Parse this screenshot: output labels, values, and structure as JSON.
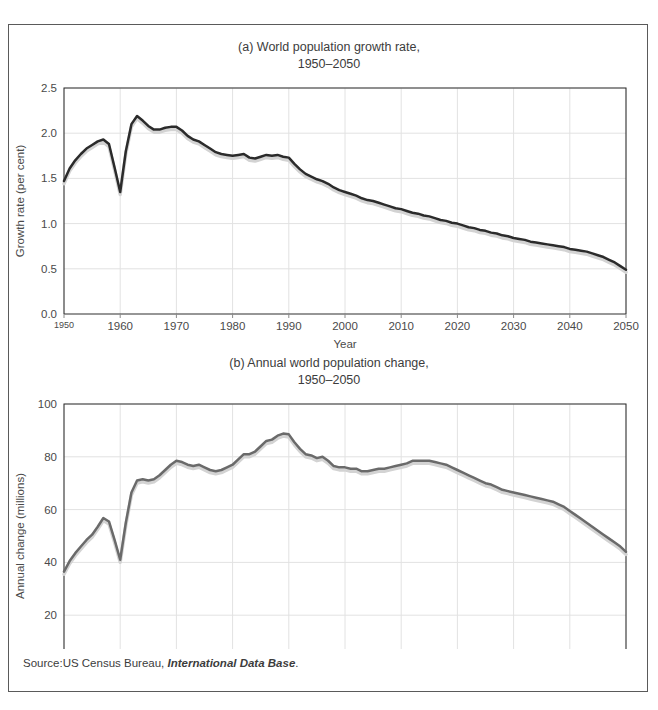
{
  "figure": {
    "source_prefix": "Source:US Census Bureau, ",
    "source_italic": "International Data Base",
    "source_suffix": "."
  },
  "colors": {
    "panel_a_line": "#2b2b2b",
    "panel_b_line": "#6a6a6a",
    "shadow": "#d3d3d3",
    "grid": "#e2e2e2",
    "axis": "#2f2f2f",
    "text": "#3c3c3c",
    "frame": "#5a5a5a"
  },
  "chart_data": [
    {
      "id": "panel-a",
      "type": "line",
      "title_line1": "(a) World population growth rate,",
      "title_line2": "1950–2050",
      "xlabel": "Year",
      "ylabel": "Growth rate (per cent)",
      "xlim": [
        1950,
        2050
      ],
      "ylim": [
        0.0,
        2.5
      ],
      "xticks": [
        1950,
        1960,
        1970,
        1980,
        1990,
        2000,
        2010,
        2020,
        2030,
        2040,
        2050
      ],
      "xticklabels": [
        "1950",
        "1960",
        "1970",
        "1980",
        "1990",
        "2000",
        "2010",
        "2020",
        "2030",
        "2040",
        "2050"
      ],
      "first_xtick_small": true,
      "yticks": [
        0.0,
        0.5,
        1.0,
        1.5,
        2.0,
        2.5
      ],
      "yticklabels": [
        "0.0",
        "0.5",
        "1.0",
        "1.5",
        "2.0",
        "2.5"
      ],
      "grid": true,
      "legend": "none",
      "series": [
        {
          "name": "World population growth rate (per cent)",
          "x": [
            1950,
            1951,
            1952,
            1953,
            1954,
            1955,
            1956,
            1957,
            1958,
            1959,
            1960,
            1961,
            1962,
            1963,
            1964,
            1965,
            1966,
            1967,
            1968,
            1969,
            1970,
            1971,
            1972,
            1973,
            1974,
            1975,
            1976,
            1977,
            1978,
            1979,
            1980,
            1981,
            1982,
            1983,
            1984,
            1985,
            1986,
            1987,
            1988,
            1989,
            1990,
            1991,
            1992,
            1993,
            1994,
            1995,
            1996,
            1997,
            1998,
            1999,
            2000,
            2001,
            2002,
            2003,
            2004,
            2005,
            2006,
            2007,
            2008,
            2009,
            2010,
            2011,
            2012,
            2013,
            2014,
            2015,
            2016,
            2017,
            2018,
            2019,
            2020,
            2021,
            2022,
            2023,
            2024,
            2025,
            2026,
            2027,
            2028,
            2029,
            2030,
            2031,
            2032,
            2033,
            2034,
            2035,
            2036,
            2037,
            2038,
            2039,
            2040,
            2041,
            2042,
            2043,
            2044,
            2045,
            2046,
            2047,
            2048,
            2049,
            2050
          ],
          "y": [
            1.47,
            1.61,
            1.7,
            1.77,
            1.83,
            1.87,
            1.91,
            1.93,
            1.88,
            1.62,
            1.35,
            1.8,
            2.1,
            2.19,
            2.14,
            2.08,
            2.04,
            2.04,
            2.06,
            2.07,
            2.07,
            2.03,
            1.97,
            1.93,
            1.91,
            1.87,
            1.83,
            1.79,
            1.77,
            1.76,
            1.75,
            1.76,
            1.77,
            1.73,
            1.72,
            1.74,
            1.76,
            1.75,
            1.76,
            1.74,
            1.73,
            1.66,
            1.6,
            1.55,
            1.52,
            1.49,
            1.47,
            1.44,
            1.4,
            1.37,
            1.35,
            1.33,
            1.31,
            1.28,
            1.26,
            1.25,
            1.23,
            1.21,
            1.19,
            1.17,
            1.16,
            1.14,
            1.12,
            1.11,
            1.09,
            1.08,
            1.06,
            1.04,
            1.03,
            1.01,
            1.0,
            0.98,
            0.96,
            0.95,
            0.93,
            0.92,
            0.9,
            0.89,
            0.87,
            0.86,
            0.84,
            0.83,
            0.82,
            0.8,
            0.79,
            0.78,
            0.77,
            0.76,
            0.75,
            0.74,
            0.72,
            0.71,
            0.7,
            0.69,
            0.67,
            0.65,
            0.63,
            0.6,
            0.57,
            0.53,
            0.49
          ]
        }
      ]
    },
    {
      "id": "panel-b",
      "type": "line",
      "title_line1": "(b) Annual world population change,",
      "title_line2": "1950–2050",
      "xlabel": "Year",
      "ylabel": "Annual change (millions)",
      "xlim": [
        1950,
        2050
      ],
      "ylim": [
        0,
        100
      ],
      "xticks": [
        1950,
        1960,
        1970,
        1980,
        1990,
        2000,
        2010,
        2020,
        2030,
        2040,
        2050
      ],
      "xticklabels": [
        "1950",
        "1960",
        "1970",
        "1980",
        "1990",
        "2000",
        "2010",
        "2020",
        "2030",
        "2040",
        "2050"
      ],
      "first_xtick_small": false,
      "yticks": [
        0,
        20,
        40,
        60,
        80,
        100
      ],
      "yticklabels": [
        "0",
        "20",
        "40",
        "60",
        "80",
        "100"
      ],
      "grid": true,
      "legend": "none",
      "series": [
        {
          "name": "Annual world population change (millions)",
          "x": [
            1950,
            1951,
            1952,
            1953,
            1954,
            1955,
            1956,
            1957,
            1958,
            1959,
            1960,
            1961,
            1962,
            1963,
            1964,
            1965,
            1966,
            1967,
            1968,
            1969,
            1970,
            1971,
            1972,
            1973,
            1974,
            1975,
            1976,
            1977,
            1978,
            1979,
            1980,
            1981,
            1982,
            1983,
            1984,
            1985,
            1986,
            1987,
            1988,
            1989,
            1990,
            1991,
            1992,
            1993,
            1994,
            1995,
            1996,
            1997,
            1998,
            1999,
            2000,
            2001,
            2002,
            2003,
            2004,
            2005,
            2006,
            2007,
            2008,
            2009,
            2010,
            2011,
            2012,
            2013,
            2014,
            2015,
            2016,
            2017,
            2018,
            2019,
            2020,
            2021,
            2022,
            2023,
            2024,
            2025,
            2026,
            2027,
            2028,
            2029,
            2030,
            2031,
            2032,
            2033,
            2034,
            2035,
            2036,
            2037,
            2038,
            2039,
            2040,
            2041,
            2042,
            2043,
            2044,
            2045,
            2046,
            2047,
            2048,
            2049,
            2050
          ],
          "y": [
            36.5,
            40.5,
            43.5,
            46.0,
            48.5,
            50.5,
            53.5,
            56.8,
            55.5,
            48.5,
            41.0,
            55.0,
            66.5,
            71.0,
            71.5,
            71.0,
            71.5,
            73.0,
            75.0,
            77.0,
            78.5,
            78.0,
            77.0,
            76.5,
            77.0,
            76.0,
            75.0,
            74.5,
            75.0,
            76.0,
            77.0,
            79.0,
            81.0,
            81.0,
            82.0,
            84.0,
            86.0,
            86.5,
            88.0,
            88.8,
            88.5,
            85.5,
            83.0,
            81.0,
            80.5,
            79.5,
            80.0,
            78.5,
            76.5,
            76.0,
            76.0,
            75.5,
            75.5,
            74.5,
            74.5,
            75.0,
            75.5,
            75.5,
            76.0,
            76.5,
            77.0,
            77.5,
            78.5,
            78.5,
            78.5,
            78.5,
            78.0,
            77.5,
            77.0,
            76.0,
            75.0,
            74.0,
            73.0,
            72.0,
            71.0,
            70.0,
            69.5,
            68.5,
            67.5,
            67.0,
            66.5,
            66.0,
            65.5,
            65.0,
            64.5,
            64.0,
            63.5,
            63.0,
            62.0,
            61.0,
            59.5,
            58.0,
            56.5,
            55.0,
            53.5,
            52.0,
            50.5,
            49.0,
            47.5,
            46.0,
            44.0
          ]
        }
      ]
    }
  ]
}
